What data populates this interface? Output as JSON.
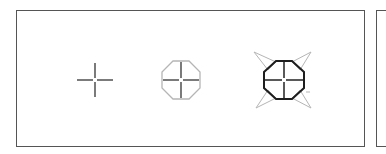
{
  "diagram": {
    "title": "",
    "panels": [
      {
        "name": "main-panel"
      },
      {
        "name": "side-panel"
      }
    ],
    "icons": [
      {
        "name": "crosshair",
        "state": "plain",
        "center": [
          95,
          80
        ]
      },
      {
        "name": "crosshair-octagon",
        "state": "light-outline",
        "center": [
          181,
          80
        ]
      },
      {
        "name": "crosshair-octagon-arrows",
        "state": "bold-outline-with-corner-arrows",
        "center": [
          284,
          80
        ]
      }
    ],
    "colors": {
      "border": "#555555",
      "stroke_dark": "#222222",
      "stroke_light": "#b5b5b5",
      "background": "#ffffff"
    }
  }
}
